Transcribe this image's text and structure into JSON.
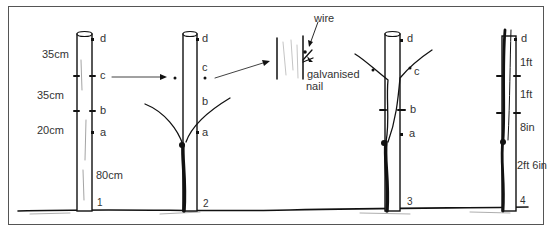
{
  "diagram": {
    "type": "vine-training-stages",
    "stages": [
      {
        "number": "1",
        "points": [
          "a",
          "b",
          "c",
          "d"
        ],
        "measurements": [
          "35cm",
          "35cm",
          "20cm",
          "80cm"
        ]
      },
      {
        "number": "2",
        "points": [
          "a",
          "b",
          "c",
          "d"
        ]
      },
      {
        "number": "3",
        "points": [
          "a",
          "b",
          "c",
          "d"
        ]
      },
      {
        "number": "4",
        "points": [
          "d"
        ],
        "measurements": [
          "1ft",
          "1ft",
          "8in",
          "2ft 6in"
        ]
      }
    ],
    "inset": {
      "labels": [
        "wire",
        "galvanised",
        "nail"
      ]
    }
  }
}
